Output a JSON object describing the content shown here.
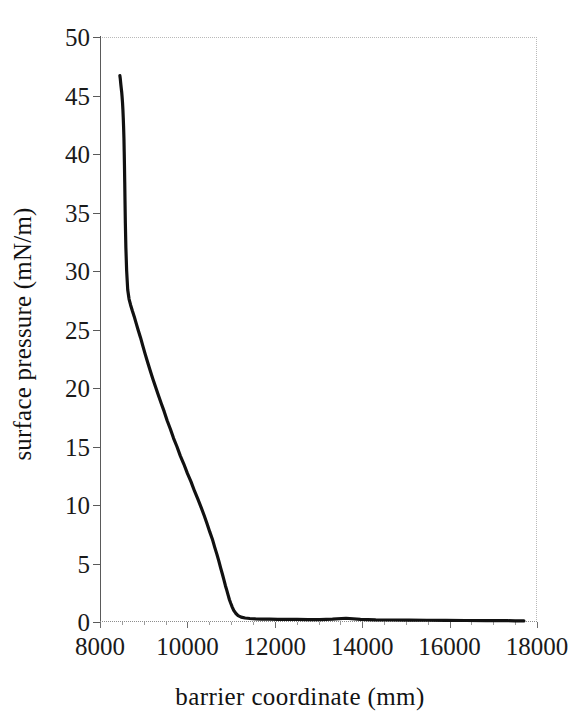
{
  "chart_data": {
    "type": "line",
    "title": "",
    "subtitle": "",
    "xlabel": "barrier coordinate (mm)",
    "ylabel": "surface pressure (mN/m)",
    "xlim": [
      8000,
      18000
    ],
    "ylim": [
      0,
      50
    ],
    "xticks": [
      8000,
      10000,
      12000,
      14000,
      16000,
      18000
    ],
    "yticks": [
      0,
      5,
      10,
      15,
      20,
      25,
      30,
      35,
      40,
      45,
      50
    ],
    "xtick_labels": [
      "8000",
      "10000",
      "12000",
      "14000",
      "16000",
      "18000"
    ],
    "ytick_labels": [
      "0",
      "5",
      "10",
      "15",
      "20",
      "25",
      "30",
      "35",
      "40",
      "45",
      "50"
    ],
    "grid": false,
    "legend": false,
    "legend_position": "none",
    "series": [
      {
        "name": "isotherm",
        "color": "#111111",
        "line_width": 3.2,
        "marker": "none",
        "x": [
          8455,
          8462,
          8470,
          8478,
          8487,
          8496,
          8505,
          8515,
          8524,
          8532,
          8540,
          8548,
          8554,
          8560,
          8566,
          8572,
          8580,
          8592,
          8610,
          8634,
          8665,
          8700,
          8740,
          8784,
          8830,
          8878,
          8928,
          8980,
          9034,
          9090,
          9148,
          9208,
          9270,
          9334,
          9400,
          9468,
          9538,
          9610,
          9684,
          9760,
          9838,
          9918,
          10000,
          10082,
          10162,
          10240,
          10314,
          10384,
          10450,
          10512,
          10570,
          10624,
          10674,
          10720,
          10762,
          10800,
          10836,
          10870,
          10902,
          10932,
          10962,
          10992,
          11024,
          11060,
          11105,
          11160,
          11230,
          11320,
          11430,
          11560,
          11710,
          11880,
          12070,
          12280,
          12510,
          12760,
          13030,
          13320,
          13630,
          13960,
          14310,
          14680,
          15070,
          15480,
          15910,
          16360,
          16830,
          17100,
          17320,
          17500,
          17620,
          17700
        ],
        "y": [
          46.7,
          46.5,
          46.2,
          45.9,
          45.6,
          45.3,
          44.9,
          44.4,
          43.8,
          43.1,
          42.3,
          41.3,
          40.2,
          39.0,
          37.6,
          36.0,
          34.1,
          32.0,
          30.0,
          28.4,
          27.6,
          27.1,
          26.6,
          26.1,
          25.5,
          24.9,
          24.3,
          23.6,
          22.9,
          22.2,
          21.5,
          20.8,
          20.1,
          19.4,
          18.7,
          18.0,
          17.2,
          16.5,
          15.7,
          15.0,
          14.2,
          13.5,
          12.7,
          12.0,
          11.2,
          10.5,
          9.8,
          9.1,
          8.4,
          7.7,
          7.1,
          6.4,
          5.8,
          5.2,
          4.6,
          4.1,
          3.6,
          3.1,
          2.7,
          2.3,
          1.9,
          1.6,
          1.3,
          1.0,
          0.75,
          0.55,
          0.42,
          0.34,
          0.3,
          0.27,
          0.25,
          0.24,
          0.23,
          0.22,
          0.22,
          0.21,
          0.21,
          0.25,
          0.32,
          0.22,
          0.18,
          0.17,
          0.16,
          0.15,
          0.14,
          0.13,
          0.12,
          0.12,
          0.11,
          0.1,
          0.1,
          0.09
        ]
      }
    ]
  },
  "figure": {
    "background_color": "#ffffff",
    "axis_color": "#5a5a5a",
    "frame_color": "#b9b9b9",
    "text_color": "#1a1a1a"
  }
}
